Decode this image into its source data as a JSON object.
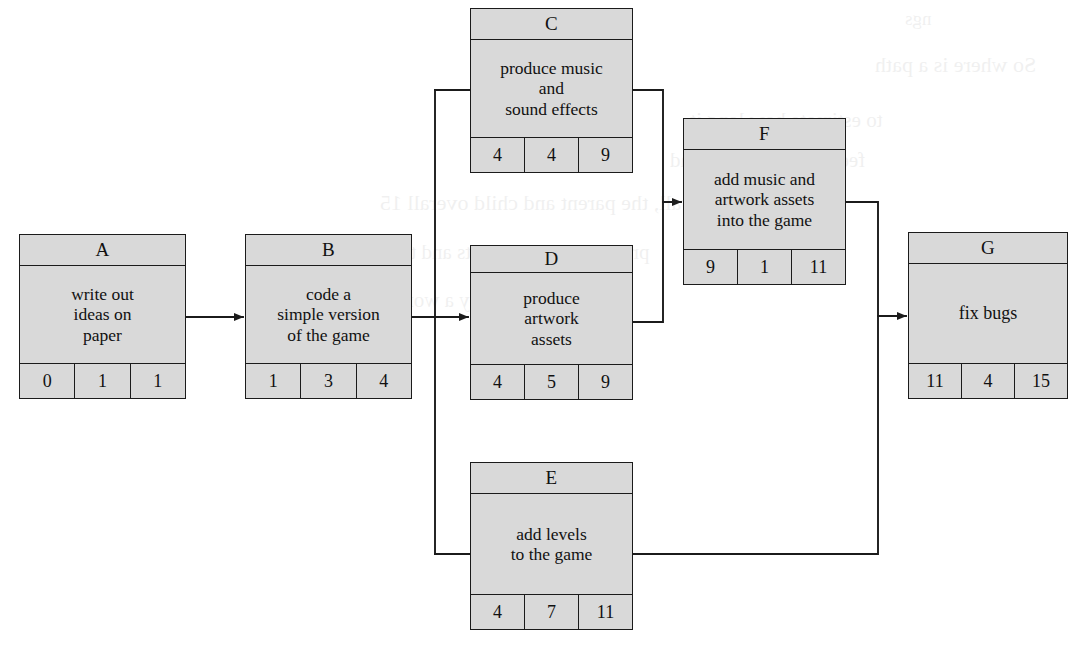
{
  "diagram": {
    "fill_color": "#d9d9d9",
    "line_color": "#1b1b1b",
    "background_color": "#ffffff",
    "number_row_headers": [
      "earliest start",
      "duration",
      "earliest finish"
    ]
  },
  "nodes": {
    "A": {
      "id": "A",
      "desc_lines": [
        "write out",
        "ideas on",
        "paper"
      ],
      "nums": [
        "0",
        "1",
        "1"
      ]
    },
    "B": {
      "id": "B",
      "desc_lines": [
        "code a",
        "simple version",
        "of the game"
      ],
      "nums": [
        "1",
        "3",
        "4"
      ]
    },
    "C": {
      "id": "C",
      "desc_lines": [
        "produce music",
        "and",
        "sound effects"
      ],
      "nums": [
        "4",
        "4",
        "9"
      ]
    },
    "D": {
      "id": "D",
      "desc_lines": [
        "produce",
        "artwork",
        "assets"
      ],
      "nums": [
        "4",
        "5",
        "9"
      ]
    },
    "E": {
      "id": "E",
      "desc_lines": [
        "add levels",
        "to the game"
      ],
      "nums": [
        "4",
        "7",
        "11"
      ]
    },
    "F": {
      "id": "F",
      "desc_lines": [
        "add music and",
        "artwork assets",
        "into the game"
      ],
      "nums": [
        "9",
        "1",
        "11"
      ]
    },
    "G": {
      "id": "G",
      "desc_lines": [
        "fix bugs"
      ],
      "nums": [
        "11",
        "4",
        "15"
      ]
    }
  },
  "edges": [
    {
      "from": "A",
      "to": "B"
    },
    {
      "from": "B",
      "to": "C"
    },
    {
      "from": "B",
      "to": "D"
    },
    {
      "from": "B",
      "to": "E"
    },
    {
      "from": "C",
      "to": "F"
    },
    {
      "from": "D",
      "to": "F"
    },
    {
      "from": "E",
      "to": "G"
    },
    {
      "from": "F",
      "to": "G"
    }
  ],
  "bleed_text": [
    "ngs",
    "So where is a path",
    "to estimate how long it",
    "feed me, plus three and",
    "Overall, the parent and child overall 15",
    "produce artwork assets and then",
    "now interpreted by a worker"
  ]
}
